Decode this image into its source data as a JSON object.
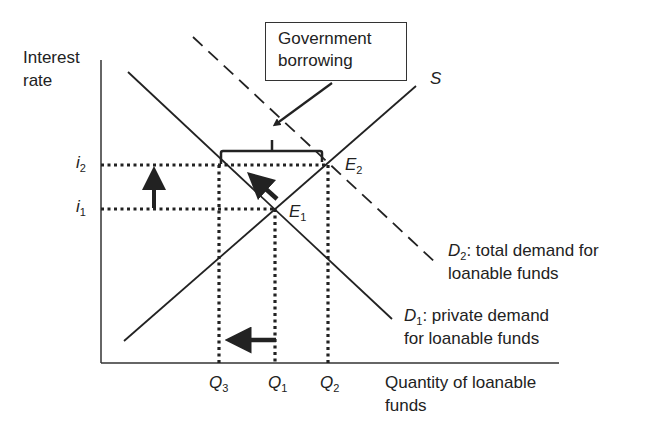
{
  "axes": {
    "y_label_line1": "Interest",
    "y_label_line2": "rate",
    "x_label_line1": "Quantity of loanable",
    "x_label_line2": "funds"
  },
  "callout": {
    "line1": "Government",
    "line2": "borrowing"
  },
  "curves": {
    "supply": {
      "symbol": "S"
    },
    "d1": {
      "symbol": "D",
      "sub": "1",
      "desc_line1": ": private demand",
      "desc_line2": "for loanable funds"
    },
    "d2": {
      "symbol": "D",
      "sub": "2",
      "desc_line1": ": total demand for",
      "desc_line2": "loanable funds"
    }
  },
  "points": {
    "e1": {
      "symbol": "E",
      "sub": "1"
    },
    "e2": {
      "symbol": "E",
      "sub": "2"
    }
  },
  "y_ticks": [
    {
      "symbol": "i",
      "sub": "2"
    },
    {
      "symbol": "i",
      "sub": "1"
    }
  ],
  "x_ticks": [
    {
      "symbol": "Q",
      "sub": "3"
    },
    {
      "symbol": "Q",
      "sub": "1"
    },
    {
      "symbol": "Q",
      "sub": "2"
    }
  ],
  "colors": {
    "ink": "#222222",
    "background": "#ffffff"
  }
}
